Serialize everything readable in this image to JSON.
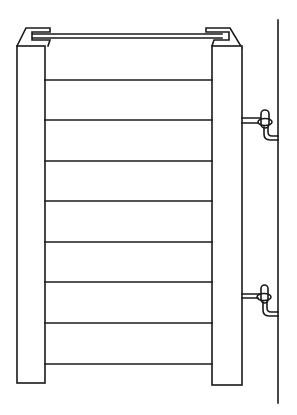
{
  "figure": {
    "type": "line-drawing",
    "colors": {
      "background": "#ffffff",
      "line": "#1a1a1a"
    },
    "ladder": {
      "rung_count": 8,
      "rung_y": [
        80,
        120,
        161,
        201,
        242,
        282,
        323,
        364
      ]
    },
    "hooks": {
      "count": 2
    },
    "wall": {
      "visible": true
    }
  }
}
